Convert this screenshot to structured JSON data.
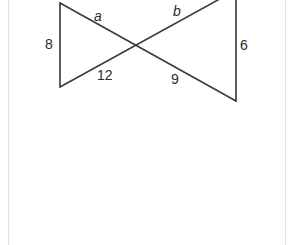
{
  "figure": {
    "colors": {
      "stroke": "#3a3a3a",
      "label": "#2b2b2b",
      "frame_border": "#e2e2e2",
      "background": "#ffffff"
    },
    "vertices": {
      "left_top": [
        60,
        3
      ],
      "left_bottom": [
        60,
        87
      ],
      "right_top": [
        236,
        -10
      ],
      "right_bottom": [
        236,
        101
      ],
      "intersection": [
        134,
        45
      ]
    },
    "labels": {
      "a": "a",
      "b": "b",
      "left_side": "8",
      "right_side": "6",
      "lower_left_segment": "12",
      "lower_right_segment": "9"
    }
  }
}
